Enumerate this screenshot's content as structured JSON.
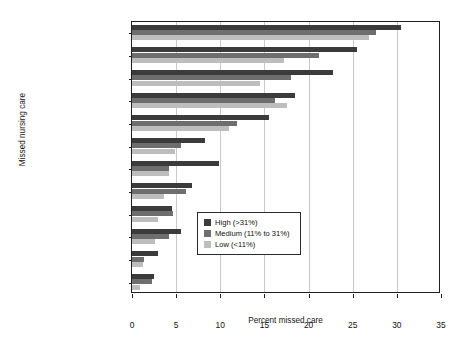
{
  "figure": {
    "top_cropped_caption": "",
    "background_color": "#ffffff"
  },
  "chart_data": {
    "type": "bar",
    "orientation": "horizontal",
    "title": "",
    "xlabel": "Percent missed care",
    "ylabel": "Missed nursing care",
    "xlim": [
      0,
      35
    ],
    "xticks": [
      0,
      5,
      10,
      15,
      20,
      25,
      30,
      35
    ],
    "xtick_labels": [
      "0",
      "5",
      "10",
      "15",
      "20",
      "25",
      "30",
      "35"
    ],
    "grid": "vertical",
    "legend_position": "lower-right-inside",
    "categories": [
      "Care plan",
      "Teach/counsel",
      "Comfort/talk",
      "Discharge prep",
      "Documentation",
      "Surveillance",
      "Meds on time",
      "Care coordination",
      "Skin care",
      "Oral hygiene",
      "Treatment/procedures",
      "Pain management"
    ],
    "series": [
      {
        "name": "High (>31%)",
        "color": "#3b3b3b",
        "values": [
          30.5,
          25.5,
          22.8,
          18.5,
          15.5,
          8.3,
          9.9,
          6.8,
          4.5,
          5.5,
          2.9,
          2.5
        ]
      },
      {
        "name": "Medium (11% to 31%)",
        "color": "#6e6e6e",
        "values": [
          27.6,
          21.2,
          18.0,
          16.2,
          11.9,
          5.5,
          4.2,
          6.1,
          4.7,
          4.2,
          1.4,
          2.3
        ]
      },
      {
        "name": "Low (<11%)",
        "color": "#bdbdbd",
        "values": [
          26.8,
          17.2,
          14.5,
          17.5,
          11.0,
          4.9,
          4.2,
          3.6,
          3.0,
          2.6,
          1.2,
          0.9
        ]
      }
    ]
  },
  "legend": {
    "items": [
      {
        "label": "High (>31%)",
        "color": "#3b3b3b"
      },
      {
        "label": "Medium (11% to 31%)",
        "color": "#6e6e6e"
      },
      {
        "label": "Low (<11%)",
        "color": "#bdbdbd"
      }
    ]
  }
}
